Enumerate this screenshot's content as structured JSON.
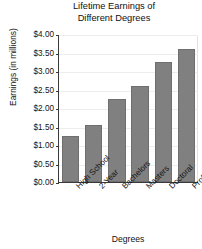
{
  "chart_data": {
    "type": "bar",
    "title": "Lifetime Earnings of Different Degrees",
    "title_lines": [
      "Lifetime Earnings of",
      "Different Degrees"
    ],
    "xlabel": "Degrees",
    "ylabel": "Earnings (in millions)",
    "categories": [
      "High School",
      "2-Year",
      "Bachelors",
      "Masters",
      "Doctoral",
      "Professional"
    ],
    "values": [
      1.25,
      1.55,
      2.25,
      2.6,
      3.25,
      3.6
    ],
    "ylim": [
      0,
      4
    ],
    "ytick_values": [
      0,
      0.5,
      1,
      1.5,
      2,
      2.5,
      3,
      3.5,
      4
    ],
    "ytick_labels": [
      "$0.00",
      "$0.50",
      "$1.00",
      "$1.50",
      "$2.00",
      "$2.50",
      "$3.00",
      "$3.50",
      "$4.00"
    ],
    "grid": true,
    "legend": false,
    "bar_color": "#808080",
    "axis_color": "#3a3a3a",
    "gridline_color": "#ededed",
    "background_color": "#ffffff"
  }
}
